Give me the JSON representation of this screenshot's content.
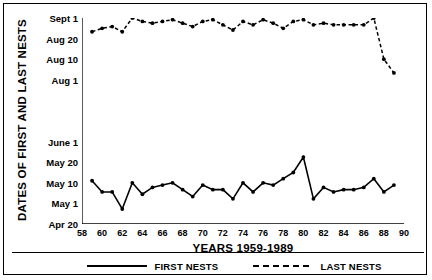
{
  "chart_data": {
    "type": "line",
    "title": "",
    "xlabel": "YEARS 1959-1989",
    "ylabel": "DATES OF FIRST AND LAST NESTS",
    "xlim": [
      58,
      90
    ],
    "xticks": [
      58,
      60,
      62,
      64,
      66,
      68,
      70,
      72,
      74,
      76,
      78,
      80,
      82,
      84,
      86,
      88,
      90
    ],
    "xticklabels": [
      "58",
      "60",
      "62",
      "64",
      "66",
      "68",
      "70",
      "72",
      "74",
      "76",
      "78",
      "80",
      "82",
      "84",
      "86",
      "88",
      "90"
    ],
    "yticks_labeled": [
      "Apr 20",
      "May 1",
      "May 10",
      "May 20",
      "June 1",
      "Aug 1",
      "Aug 10",
      "Aug 20",
      "Sept 1"
    ],
    "y_axis_note": "Non-linear date axis; unlabeled minor ticks occupy the gap between June 1 and Aug 1",
    "grid": false,
    "legend_position": "below-axis",
    "x": [
      1959,
      1960,
      1961,
      1962,
      1963,
      1964,
      1965,
      1966,
      1967,
      1968,
      1969,
      1970,
      1971,
      1972,
      1973,
      1974,
      1975,
      1976,
      1977,
      1978,
      1979,
      1980,
      1981,
      1982,
      1983,
      1984,
      1985,
      1986,
      1987,
      1988,
      1989
    ],
    "series": [
      {
        "name": "FIRST NESTS",
        "style": "solid",
        "marker": "filled-circle",
        "values": [
          "May 11",
          "May 6",
          "May 6",
          "Apr 28",
          "May 10",
          "May 5",
          "May 8",
          "May 9",
          "May 10",
          "May 7",
          "May 4",
          "May 9",
          "May 7",
          "May 7",
          "May 3",
          "May 10",
          "May 6",
          "May 10",
          "May 9",
          "May 12",
          "May 15",
          "May 23",
          "May 3",
          "May 8",
          "May 6",
          "May 7",
          "May 7",
          "May 8",
          "May 12",
          "May 6",
          "May 9"
        ],
        "values_doy": [
          131,
          126,
          126,
          118,
          130,
          125,
          128,
          129,
          130,
          127,
          124,
          129,
          127,
          127,
          123,
          130,
          126,
          130,
          129,
          132,
          135,
          143,
          123,
          128,
          126,
          127,
          127,
          128,
          132,
          126,
          129
        ]
      },
      {
        "name": "LAST NESTS",
        "style": "dashed",
        "marker": "filled-circle",
        "values": [
          "Aug 24",
          "Aug 26",
          "Aug 27",
          "Aug 24",
          "Sept 3",
          "Aug 30",
          "Aug 29",
          "Aug 30",
          "Aug 31",
          "Aug 29",
          "Aug 27",
          "Aug 30",
          "Aug 31",
          "Aug 28",
          "Aug 25",
          "Aug 30",
          "Aug 28",
          "Aug 31",
          "Aug 29",
          "Aug 26",
          "Aug 30",
          "Aug 31",
          "Aug 28",
          "Aug 29",
          "Aug 28",
          "Aug 28",
          "Aug 28",
          "Aug 28",
          "Sept 4",
          "Aug 10",
          "Aug 4"
        ],
        "values_doy": [
          236,
          238,
          239,
          236,
          246,
          242,
          241,
          242,
          243,
          241,
          239,
          242,
          243,
          240,
          237,
          242,
          240,
          243,
          241,
          238,
          242,
          243,
          240,
          241,
          240,
          240,
          240,
          240,
          247,
          222,
          216
        ]
      }
    ]
  },
  "legend": {
    "items": [
      {
        "label": "FIRST NESTS",
        "style": "solid"
      },
      {
        "label": "LAST NESTS",
        "style": "dashed"
      }
    ]
  }
}
